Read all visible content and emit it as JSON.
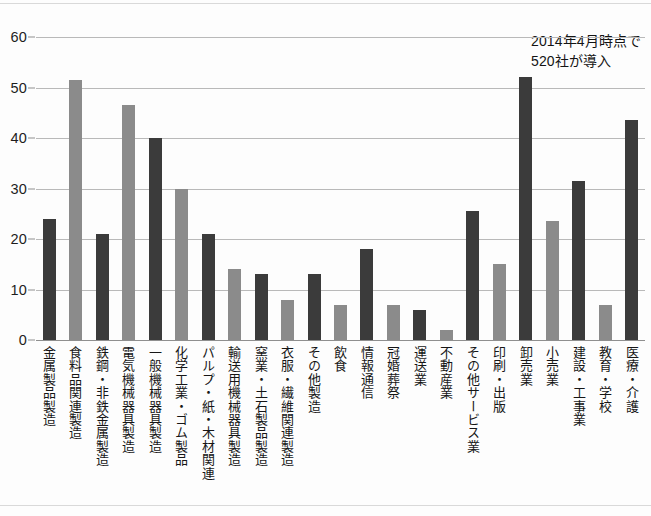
{
  "annotation": {
    "line1": "2014年4月時点で",
    "line2": "520社が導入"
  },
  "chart_data": {
    "type": "bar",
    "title": "",
    "subtitle": "",
    "xlabel": "",
    "ylabel": "",
    "ylim": [
      0,
      60
    ],
    "yticks": [
      0,
      10,
      20,
      30,
      40,
      50,
      60
    ],
    "ytick_labels": [
      "0",
      "10",
      "20",
      "30",
      "40",
      "50",
      "60"
    ],
    "grid": true,
    "legend": "none",
    "annotations": [
      "2014年4月時点で",
      "520社が導入"
    ],
    "colors": {
      "dark_bar": "#3b3b3b",
      "light_bar": "#8b8b8b",
      "gridline": "#b9b9b9",
      "axis": "#8f8f8f",
      "background": "#fdfdfd",
      "text": "#161616"
    },
    "categories": [
      "金属製品製造",
      "食料品関連製造",
      "鉄鋼・非鉄金属製造",
      "電気機械器具製造",
      "一般機械器具製造",
      "化学工業・ゴム製品",
      "パルプ・紙・木材関連",
      "輸送用機械器具製造",
      "窯業・土石製品製造",
      "衣服・繊維関連製造",
      "その他製造",
      "飲食",
      "情報通信",
      "冠婚葬祭",
      "運送業",
      "不動産業",
      "その他サービス業",
      "印刷・出版",
      "卸売業",
      "小売業",
      "建設・工事業",
      "教育・学校",
      "医療・介護"
    ],
    "values": [
      24,
      51.5,
      21,
      46.5,
      40,
      30,
      21,
      14,
      13,
      8,
      13,
      7,
      18,
      7,
      6,
      2,
      25.5,
      15,
      52,
      23.5,
      31.5,
      7,
      43.5
    ],
    "bar_shades": [
      "dark",
      "light",
      "dark",
      "light",
      "dark",
      "light",
      "dark",
      "light",
      "dark",
      "light",
      "dark",
      "light",
      "dark",
      "light",
      "dark",
      "light",
      "dark",
      "light",
      "dark",
      "light",
      "dark",
      "light",
      "dark"
    ]
  }
}
